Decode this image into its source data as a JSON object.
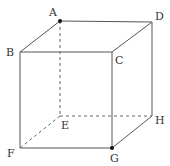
{
  "diagram": {
    "type": "cube",
    "stroke_color": "#555555",
    "vertices": {
      "A": {
        "x": 60,
        "y": 21,
        "label": "A",
        "lx": 49,
        "ly": 16,
        "dot": true
      },
      "B": {
        "x": 20,
        "y": 52,
        "label": "B",
        "lx": 6,
        "ly": 56,
        "dot": false
      },
      "C": {
        "x": 112,
        "y": 52,
        "label": "C",
        "lx": 115,
        "ly": 64,
        "dot": false
      },
      "D": {
        "x": 152,
        "y": 22,
        "label": "D",
        "lx": 155,
        "ly": 20,
        "dot": false
      },
      "E": {
        "x": 60,
        "y": 116,
        "label": "E",
        "lx": 61,
        "ly": 129,
        "dot": false
      },
      "F": {
        "x": 20,
        "y": 148,
        "label": "F",
        "lx": 7,
        "ly": 157,
        "dot": false
      },
      "G": {
        "x": 112,
        "y": 148,
        "label": "G",
        "lx": 110,
        "ly": 162,
        "dot": true
      },
      "H": {
        "x": 152,
        "y": 116,
        "label": "H",
        "lx": 155,
        "ly": 124,
        "dot": false
      }
    },
    "solid_edges": [
      "AB",
      "AD",
      "BC",
      "CD",
      "BF",
      "CG",
      "DH",
      "FG",
      "GH"
    ],
    "dashed_edges": [
      "AE",
      "EF",
      "EH"
    ]
  }
}
